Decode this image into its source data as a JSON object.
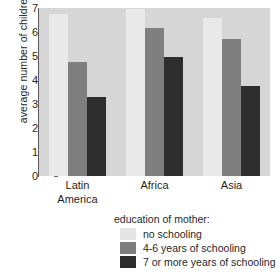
{
  "chart_data": {
    "type": "bar",
    "title": "",
    "xlabel": "",
    "ylabel": "average number of children",
    "categories": [
      "Latin America",
      "Africa",
      "Asia"
    ],
    "series": [
      {
        "name": "no schooling",
        "color": "#e9e9e9",
        "values": [
          6.75,
          6.95,
          6.6
        ]
      },
      {
        "name": "4-6 years of schooling",
        "color": "#7f7f7f",
        "values": [
          4.75,
          6.15,
          5.7
        ]
      },
      {
        "name": "7 or more years of schooling",
        "color": "#2d2d2d",
        "values": [
          3.3,
          4.95,
          3.75
        ]
      }
    ],
    "ylim": [
      0,
      7
    ],
    "yticks": [
      "0",
      "1",
      "2",
      "3",
      "4",
      "5",
      "6",
      "7"
    ],
    "grid": false,
    "legend_position": "bottom",
    "legend_title": "education of mother:",
    "plot_background": "#d6d6d6"
  },
  "xticklabels": [
    {
      "line1": "Latin",
      "line2": "America"
    },
    {
      "line1": "Africa",
      "line2": ""
    },
    {
      "line1": "Asia",
      "line2": ""
    }
  ]
}
